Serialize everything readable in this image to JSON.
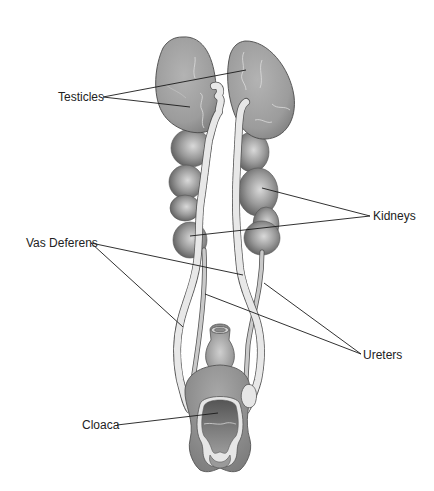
{
  "diagram": {
    "labels": {
      "testicles": "Testicles",
      "kidneys": "Kidneys",
      "vas_deferens": "Vas Deferens",
      "ureters": "Ureters",
      "cloaca": "Cloaca"
    },
    "colors": {
      "background": "#ffffff",
      "organ_gray": "#9a9a9a",
      "organ_dark": "#6e6e6e",
      "duct_light": "#e6e6e6",
      "outline": "#555555",
      "text": "#222222",
      "leader": "#1a1a1a"
    }
  }
}
